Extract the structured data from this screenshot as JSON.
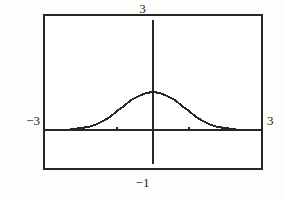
{
  "screen": {
    "title": "Graphing calculator viewport",
    "background_color": "#fdfdfc",
    "plot_background_color": "#ffffff",
    "ink_color": "#262626"
  },
  "axis_labels": {
    "y_max": "3",
    "y_min": "−1",
    "x_min": "−3",
    "x_max": "3"
  },
  "chart_data": {
    "type": "line",
    "title": "",
    "subtitle": "",
    "xlabel": "",
    "ylabel": "",
    "xlim": [
      -3,
      3
    ],
    "ylim": [
      -1,
      3
    ],
    "grid": false,
    "legend": null,
    "axes": {
      "x_axis_y_value": 0,
      "y_axis_x_value": 0,
      "x_tick_values": [
        -1,
        1
      ],
      "y_tick_values": [
        1
      ],
      "tick_mark_size_px": 3
    },
    "annotations": [
      {
        "text": "3",
        "position": "top-center-outside",
        "meaning": "Ymax"
      },
      {
        "text": "−1",
        "position": "bottom-center-outside",
        "meaning": "Ymin"
      },
      {
        "text": "−3",
        "position": "left-middle-outside",
        "meaning": "Xmin"
      },
      {
        "text": "3",
        "position": "right-middle-outside",
        "meaning": "Xmax"
      }
    ],
    "series": [
      {
        "name": "bell curve",
        "style": "solid",
        "color": "#262626",
        "x": [
          -3.0,
          -2.8,
          -2.6,
          -2.4,
          -2.2,
          -2.0,
          -1.8,
          -1.6,
          -1.4,
          -1.2,
          -1.0,
          -0.8,
          -0.6,
          -0.4,
          -0.2,
          0.0,
          0.2,
          0.4,
          0.6,
          0.8,
          1.0,
          1.2,
          1.4,
          1.6,
          1.8,
          2.0,
          2.2,
          2.4,
          2.6,
          2.8,
          3.0
        ],
        "y": [
          0.0,
          0.0,
          0.0,
          0.01,
          0.02,
          0.04,
          0.08,
          0.14,
          0.23,
          0.35,
          0.49,
          0.64,
          0.78,
          0.89,
          0.97,
          1.0,
          0.97,
          0.89,
          0.78,
          0.64,
          0.49,
          0.35,
          0.23,
          0.14,
          0.08,
          0.04,
          0.02,
          0.01,
          0.0,
          0.0,
          0.0
        ]
      }
    ]
  }
}
